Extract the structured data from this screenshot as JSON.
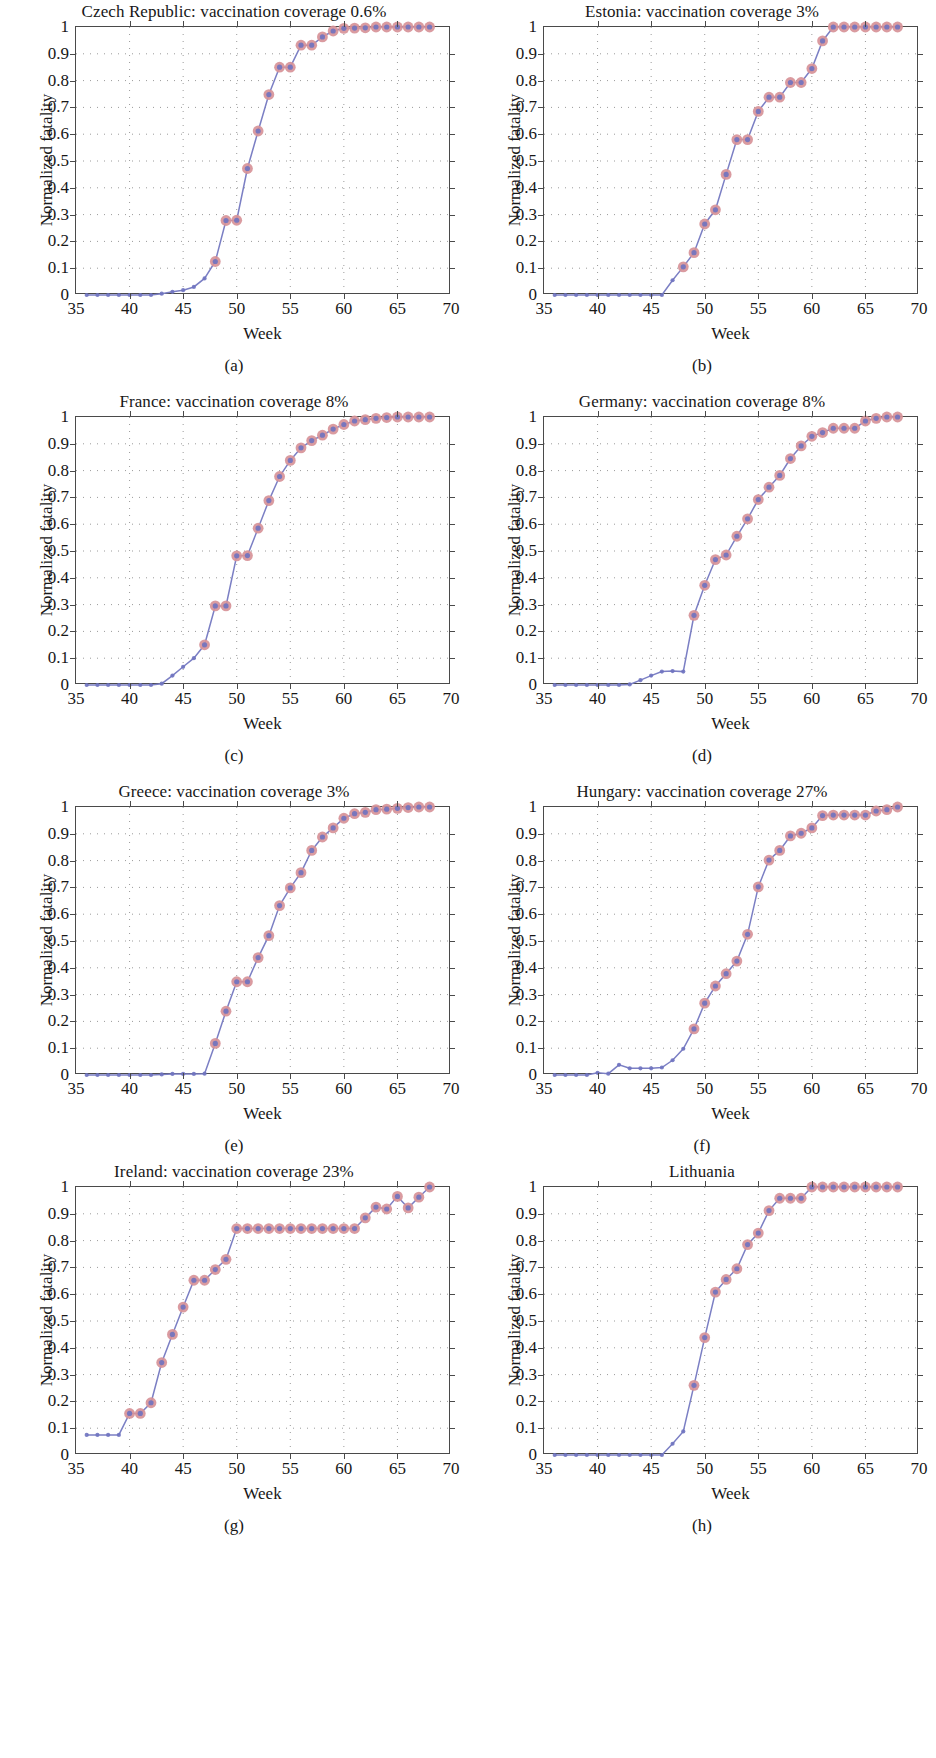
{
  "figure": {
    "axis_label_x": "Week",
    "axis_label_y": "Normalized fatality",
    "xticks": [
      35,
      40,
      45,
      50,
      55,
      60,
      65,
      70
    ],
    "yticks": [
      "0",
      "0.1",
      "0.2",
      "0.3",
      "0.4",
      "0.5",
      "0.6",
      "0.7",
      "0.8",
      "0.9",
      "1"
    ],
    "xlim": [
      35,
      70
    ],
    "ylim": [
      0,
      1
    ],
    "line_color": "#7b7fc4",
    "marker_face_color": "#d79398",
    "marker_dot_color": "#6f73c0",
    "axis_color": "#4a4a4a",
    "grid_color": "#9a9a9a"
  },
  "panels": [
    {
      "caption": "(a)",
      "title": "Czech Republic: vaccination coverage 0.6%"
    },
    {
      "caption": "(b)",
      "title": "Estonia: vaccination coverage 3%"
    },
    {
      "caption": "(c)",
      "title": "France: vaccination coverage 8%"
    },
    {
      "caption": "(d)",
      "title": "Germany: vaccination coverage 8%"
    },
    {
      "caption": "(e)",
      "title": "Greece: vaccination coverage 3%"
    },
    {
      "caption": "(f)",
      "title": "Hungary: vaccination coverage 27%"
    },
    {
      "caption": "(g)",
      "title": "Ireland: vaccination coverage 23%"
    },
    {
      "caption": "(h)",
      "title": "Lithuania"
    }
  ],
  "chart_data": [
    {
      "type": "line",
      "title": "Czech Republic: vaccination coverage 0.6%",
      "subplot": "(a)",
      "xlabel": "Week",
      "ylabel": "Normalized fatality",
      "xlim": [
        35,
        70
      ],
      "ylim": [
        0,
        1
      ],
      "grid": true,
      "legend": "none",
      "x": [
        36,
        37,
        38,
        39,
        40,
        41,
        42,
        43,
        44,
        45,
        46,
        47,
        48,
        49,
        50,
        51,
        52,
        53,
        54,
        55,
        56,
        57,
        58,
        59,
        60,
        61,
        62,
        63,
        64,
        65,
        66,
        67,
        68
      ],
      "y": [
        0,
        0,
        0,
        0,
        0,
        0,
        0,
        0.005,
        0.012,
        0.018,
        0.03,
        0.062,
        0.125,
        0.278,
        0.279,
        0.472,
        0.612,
        0.748,
        0.85,
        0.85,
        0.932,
        0.932,
        0.963,
        0.985,
        0.995,
        0.996,
        0.997,
        1,
        1,
        1,
        1,
        1,
        1
      ]
    },
    {
      "type": "line",
      "title": "Estonia: vaccination coverage 3%",
      "subplot": "(b)",
      "xlabel": "Week",
      "ylabel": "Normalized fatality",
      "xlim": [
        35,
        70
      ],
      "ylim": [
        0,
        1
      ],
      "grid": true,
      "legend": "none",
      "x": [
        36,
        37,
        38,
        39,
        40,
        41,
        42,
        43,
        44,
        45,
        46,
        47,
        48,
        49,
        50,
        51,
        52,
        53,
        54,
        55,
        56,
        57,
        58,
        59,
        60,
        61,
        62,
        63,
        64,
        65,
        66,
        67,
        68
      ],
      "y": [
        0,
        0,
        0,
        0,
        0,
        0,
        0,
        0,
        0,
        0,
        0,
        0.055,
        0.105,
        0.158,
        0.265,
        0.318,
        0.45,
        0.58,
        0.58,
        0.685,
        0.738,
        0.738,
        0.793,
        0.793,
        0.845,
        0.948,
        1,
        1,
        1,
        1,
        1,
        1,
        1
      ]
    },
    {
      "type": "line",
      "title": "France: vaccination coverage 8%",
      "subplot": "(c)",
      "xlabel": "Week",
      "ylabel": "Normalized fatality",
      "xlim": [
        35,
        70
      ],
      "ylim": [
        0,
        1
      ],
      "grid": true,
      "legend": "none",
      "x": [
        36,
        37,
        38,
        39,
        40,
        41,
        42,
        43,
        44,
        45,
        46,
        47,
        48,
        49,
        50,
        51,
        52,
        53,
        54,
        55,
        56,
        57,
        58,
        59,
        60,
        61,
        62,
        63,
        64,
        65,
        66,
        67,
        68
      ],
      "y": [
        0,
        0,
        0,
        0,
        0,
        0,
        0,
        0.005,
        0.035,
        0.068,
        0.1,
        0.15,
        0.295,
        0.295,
        0.482,
        0.483,
        0.585,
        0.688,
        0.778,
        0.838,
        0.885,
        0.912,
        0.932,
        0.955,
        0.972,
        0.985,
        0.99,
        0.995,
        0.998,
        1,
        1,
        1,
        1
      ]
    },
    {
      "type": "line",
      "title": "Germany: vaccination coverage 8%",
      "subplot": "(d)",
      "xlabel": "Week",
      "ylabel": "Normalized fatality",
      "xlim": [
        35,
        70
      ],
      "ylim": [
        0,
        1
      ],
      "grid": true,
      "legend": "none",
      "x": [
        36,
        37,
        38,
        39,
        40,
        41,
        42,
        43,
        44,
        45,
        46,
        47,
        48,
        49,
        50,
        51,
        52,
        53,
        54,
        55,
        56,
        57,
        58,
        59,
        60,
        61,
        62,
        63,
        64,
        65,
        66,
        67,
        68
      ],
      "y": [
        0,
        0,
        0,
        0,
        0,
        0,
        0,
        0.002,
        0.018,
        0.035,
        0.05,
        0.052,
        0.05,
        0.26,
        0.372,
        0.468,
        0.485,
        0.555,
        0.62,
        0.692,
        0.738,
        0.782,
        0.845,
        0.892,
        0.928,
        0.942,
        0.958,
        0.958,
        0.958,
        0.985,
        0.995,
        1,
        1
      ]
    },
    {
      "type": "line",
      "title": "Greece: vaccination coverage 3%",
      "subplot": "(e)",
      "xlabel": "Week",
      "ylabel": "Normalized fatality",
      "xlim": [
        35,
        70
      ],
      "ylim": [
        0,
        1
      ],
      "grid": true,
      "legend": "none",
      "x": [
        36,
        37,
        38,
        39,
        40,
        41,
        42,
        43,
        44,
        45,
        46,
        47,
        48,
        49,
        50,
        51,
        52,
        53,
        54,
        55,
        56,
        57,
        58,
        59,
        60,
        61,
        62,
        63,
        64,
        65,
        66,
        67,
        68
      ],
      "y": [
        0,
        0,
        0,
        0,
        0,
        0,
        0,
        0.002,
        0.004,
        0.004,
        0.004,
        0.005,
        0.118,
        0.238,
        0.348,
        0.348,
        0.438,
        0.52,
        0.632,
        0.698,
        0.755,
        0.838,
        0.888,
        0.922,
        0.958,
        0.975,
        0.98,
        0.99,
        0.992,
        0.995,
        0.998,
        1,
        1
      ]
    },
    {
      "type": "line",
      "title": "Hungary: vaccination coverage 27%",
      "subplot": "(f)",
      "xlabel": "Week",
      "ylabel": "Normalized fatality",
      "xlim": [
        35,
        70
      ],
      "ylim": [
        0,
        1
      ],
      "grid": true,
      "legend": "none",
      "x": [
        36,
        37,
        38,
        39,
        40,
        41,
        42,
        43,
        44,
        45,
        46,
        47,
        48,
        49,
        50,
        51,
        52,
        53,
        54,
        55,
        56,
        57,
        58,
        59,
        60,
        61,
        62,
        63,
        64,
        65,
        66,
        67,
        68
      ],
      "y": [
        0,
        0,
        0,
        0,
        0.008,
        0.005,
        0.038,
        0.025,
        0.025,
        0.025,
        0.028,
        0.055,
        0.098,
        0.172,
        0.268,
        0.332,
        0.378,
        0.425,
        0.525,
        0.702,
        0.802,
        0.838,
        0.892,
        0.902,
        0.922,
        0.968,
        0.97,
        0.97,
        0.97,
        0.97,
        0.985,
        0.99,
        1
      ]
    },
    {
      "type": "line",
      "title": "Ireland: vaccination coverage 23%",
      "subplot": "(g)",
      "xlabel": "Week",
      "ylabel": "Normalized fatality",
      "xlim": [
        35,
        70
      ],
      "ylim": [
        0,
        1
      ],
      "grid": true,
      "legend": "none",
      "x": [
        36,
        37,
        38,
        39,
        40,
        41,
        42,
        43,
        44,
        45,
        46,
        47,
        48,
        49,
        50,
        51,
        52,
        53,
        54,
        55,
        56,
        57,
        58,
        59,
        60,
        61,
        62,
        63,
        64,
        65,
        66,
        67,
        68
      ],
      "y": [
        0.075,
        0.075,
        0.075,
        0.075,
        0.155,
        0.155,
        0.195,
        0.345,
        0.45,
        0.552,
        0.652,
        0.652,
        0.692,
        0.73,
        0.845,
        0.845,
        0.845,
        0.845,
        0.845,
        0.845,
        0.845,
        0.845,
        0.845,
        0.845,
        0.845,
        0.845,
        0.885,
        0.925,
        0.918,
        0.965,
        0.922,
        0.962,
        1
      ]
    },
    {
      "type": "line",
      "title": "Lithuania",
      "subplot": "(h)",
      "xlabel": "Week",
      "ylabel": "Normalized fatality",
      "xlim": [
        35,
        70
      ],
      "ylim": [
        0,
        1
      ],
      "grid": true,
      "legend": "none",
      "x": [
        36,
        37,
        38,
        39,
        40,
        41,
        42,
        43,
        44,
        45,
        46,
        47,
        48,
        49,
        50,
        51,
        52,
        53,
        54,
        55,
        56,
        57,
        58,
        59,
        60,
        61,
        62,
        63,
        64,
        65,
        66,
        67,
        68
      ],
      "y": [
        0,
        0,
        0,
        0,
        0,
        0,
        0,
        0,
        0,
        0,
        0,
        0.042,
        0.088,
        0.26,
        0.438,
        0.608,
        0.655,
        0.695,
        0.785,
        0.828,
        0.912,
        0.958,
        0.958,
        0.958,
        1,
        1,
        1,
        1,
        1,
        1,
        1,
        1,
        1
      ]
    }
  ]
}
